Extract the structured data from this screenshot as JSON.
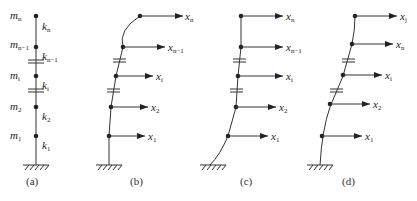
{
  "figure": {
    "panels": [
      {
        "id": "a",
        "caption": "(a)",
        "masses": [
          {
            "base": "m",
            "sub": "n"
          },
          {
            "base": "m",
            "sub": "n−1"
          },
          {
            "base": "m",
            "sub": "i"
          },
          {
            "base": "m",
            "sub": "2"
          },
          {
            "base": "m",
            "sub": "1"
          }
        ],
        "springs": [
          {
            "base": "k",
            "sub": "n"
          },
          {
            "base": "k",
            "sub": "n−1"
          },
          {
            "base": "k",
            "sub": "i"
          },
          {
            "base": "k",
            "sub": "2"
          },
          {
            "base": "k",
            "sub": "1"
          }
        ]
      },
      {
        "id": "b",
        "caption": "(b)",
        "displacements": [
          {
            "base": "x",
            "sub": "n"
          },
          {
            "base": "x",
            "sub": "n−1"
          },
          {
            "base": "x",
            "sub": "i"
          },
          {
            "base": "x",
            "sub": "2"
          },
          {
            "base": "x",
            "sub": "1"
          }
        ]
      },
      {
        "id": "c",
        "caption": "(c)",
        "displacements": [
          {
            "base": "x",
            "sub": "n"
          },
          {
            "base": "x",
            "sub": "n−1"
          },
          {
            "base": "x",
            "sub": "i"
          },
          {
            "base": "x",
            "sub": "2"
          },
          {
            "base": "x",
            "sub": "1"
          }
        ]
      },
      {
        "id": "d",
        "caption": "(d)",
        "displacements": [
          {
            "base": "x",
            "sub": "j"
          },
          {
            "base": "x",
            "sub": "n"
          },
          {
            "base": "x",
            "sub": "i"
          },
          {
            "base": "x",
            "sub": "2"
          },
          {
            "base": "x",
            "sub": "1"
          }
        ]
      }
    ]
  }
}
